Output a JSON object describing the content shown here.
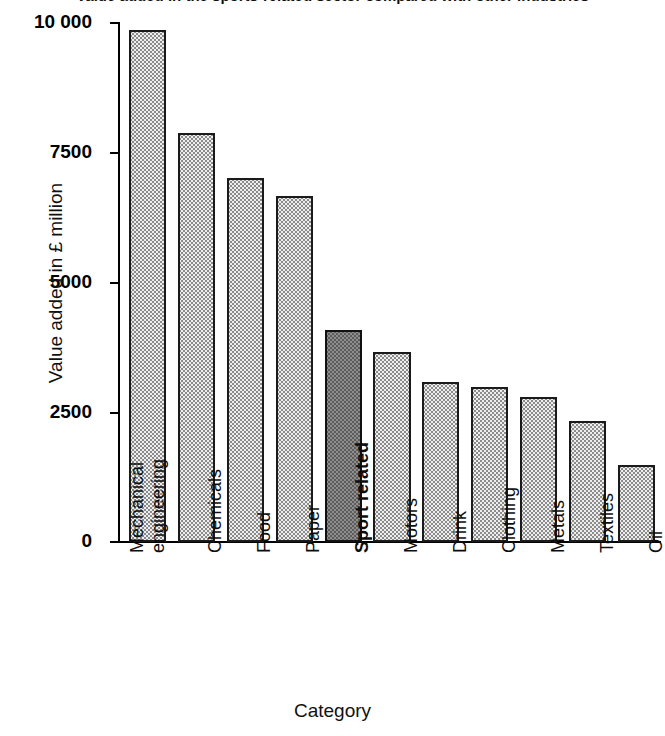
{
  "chart_data": {
    "type": "bar",
    "title": "Value added in the sports-related sector compared with other industries",
    "xlabel": "Category",
    "ylabel": "Value added in £ million",
    "ylim": [
      0,
      10000
    ],
    "yticks": [
      0,
      2500,
      5000,
      7500,
      10000
    ],
    "ytick_labels": [
      "0",
      "2500",
      "5000",
      "7500",
      "10 000"
    ],
    "grid": false,
    "legend": "none",
    "highlight_category": "Sport related",
    "highlight_color": "#8e8e8e",
    "bar_color": "#eeeeee",
    "bar_edge_color": "#1a1a1a",
    "categories": [
      "Mechanical engineering",
      "Chemicals",
      "Food",
      "Paper",
      "Sport related",
      "Motors",
      "Drink",
      "Clothing",
      "Metals",
      "Textiles",
      "Oil"
    ],
    "category_lines": [
      [
        "Mechanical",
        "engineering"
      ],
      [
        "Chemicals"
      ],
      [
        "Food"
      ],
      [
        "Paper"
      ],
      [
        "Sport related"
      ],
      [
        "Motors"
      ],
      [
        "Drink"
      ],
      [
        "Clothing"
      ],
      [
        "Metals"
      ],
      [
        "Textiles"
      ],
      [
        "Oil"
      ]
    ],
    "values": [
      9850,
      7870,
      7000,
      6650,
      4080,
      3650,
      3080,
      2980,
      2790,
      2330,
      1480
    ]
  }
}
